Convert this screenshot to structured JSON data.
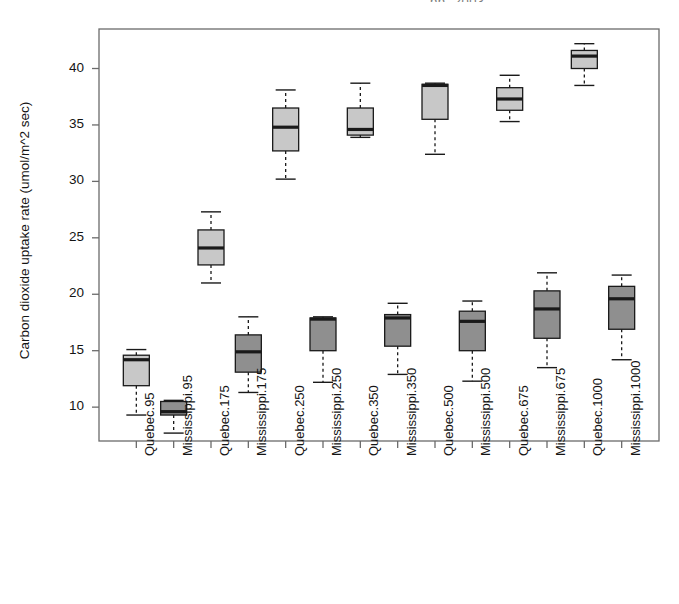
{
  "figure": {
    "partial_top_text": "pp.  2003",
    "ylabel": "Carbon dioxide uptake rate (umol/m^2 sec)",
    "colors": {
      "quebec_fill": "#c8c8c8",
      "mississippi_fill": "#8f8f8f",
      "line": "#1a1a1a",
      "axis": "#6b6b6b",
      "background": "#ffffff"
    }
  },
  "chart_data": {
    "type": "box",
    "title": "",
    "xlabel": "",
    "ylabel": "Carbon dioxide uptake rate (umol/m^2 sec)",
    "ylim": [
      7.0,
      43.5
    ],
    "yticks": [
      10,
      15,
      20,
      25,
      30,
      35,
      40
    ],
    "ytick_labels": [
      "10",
      "15",
      "20",
      "25",
      "30",
      "35",
      "40"
    ],
    "grid": false,
    "legend": "none",
    "categories": [
      "Quebec.95",
      "Mississippi.95",
      "Quebec.175",
      "Mississippi.175",
      "Quebec.250",
      "Mississippi.250",
      "Quebec.350",
      "Mississippi.350",
      "Quebec.500",
      "Mississippi.500",
      "Quebec.675",
      "Mississippi.675",
      "Quebec.1000",
      "Mississippi.1000"
    ],
    "boxes": [
      {
        "label": "Quebec.95",
        "type": "Quebec",
        "conc": 95,
        "whisker_low": 9.3,
        "q1": 11.9,
        "median": 14.2,
        "q3": 14.6,
        "whisker_high": 15.1
      },
      {
        "label": "Mississippi.95",
        "type": "Mississippi",
        "conc": 95,
        "whisker_low": 7.7,
        "q1": 9.3,
        "median": 9.6,
        "q3": 10.5,
        "whisker_high": 10.6
      },
      {
        "label": "Quebec.175",
        "type": "Quebec",
        "conc": 175,
        "whisker_low": 21.0,
        "q1": 22.6,
        "median": 24.1,
        "q3": 25.7,
        "whisker_high": 27.3
      },
      {
        "label": "Mississippi.175",
        "type": "Mississippi",
        "conc": 175,
        "whisker_low": 11.3,
        "q1": 13.1,
        "median": 14.9,
        "q3": 16.4,
        "whisker_high": 18.0
      },
      {
        "label": "Quebec.250",
        "type": "Quebec",
        "conc": 250,
        "whisker_low": 30.2,
        "q1": 32.7,
        "median": 34.8,
        "q3": 36.5,
        "whisker_high": 38.1
      },
      {
        "label": "Mississippi.250",
        "type": "Mississippi",
        "conc": 250,
        "whisker_low": 12.2,
        "q1": 15.0,
        "median": 17.8,
        "q3": 17.9,
        "whisker_high": 18.0
      },
      {
        "label": "Quebec.350",
        "type": "Quebec",
        "conc": 350,
        "whisker_low": 33.9,
        "q1": 34.1,
        "median": 34.6,
        "q3": 36.5,
        "whisker_high": 38.7
      },
      {
        "label": "Mississippi.350",
        "type": "Mississippi",
        "conc": 350,
        "whisker_low": 12.9,
        "q1": 15.4,
        "median": 17.9,
        "q3": 18.2,
        "whisker_high": 19.2
      },
      {
        "label": "Quebec.500",
        "type": "Quebec",
        "conc": 500,
        "whisker_low": 32.4,
        "q1": 35.5,
        "median": 38.5,
        "q3": 38.6,
        "whisker_high": 38.7
      },
      {
        "label": "Mississippi.500",
        "type": "Mississippi",
        "conc": 500,
        "whisker_low": 12.3,
        "q1": 15.0,
        "median": 17.6,
        "q3": 18.5,
        "whisker_high": 19.4
      },
      {
        "label": "Quebec.675",
        "type": "Quebec",
        "conc": 675,
        "whisker_low": 35.3,
        "q1": 36.3,
        "median": 37.3,
        "q3": 38.3,
        "whisker_high": 39.4
      },
      {
        "label": "Mississippi.675",
        "type": "Mississippi",
        "conc": 675,
        "whisker_low": 13.5,
        "q1": 16.1,
        "median": 18.7,
        "q3": 20.3,
        "whisker_high": 21.9
      },
      {
        "label": "Quebec.1000",
        "type": "Quebec",
        "conc": 1000,
        "whisker_low": 38.5,
        "q1": 40.0,
        "median": 41.1,
        "q3": 41.6,
        "whisker_high": 42.2
      },
      {
        "label": "Mississippi.1000",
        "type": "Mississippi",
        "conc": 1000,
        "whisker_low": 14.2,
        "q1": 16.9,
        "median": 19.6,
        "q3": 20.7,
        "whisker_high": 21.7
      }
    ]
  }
}
